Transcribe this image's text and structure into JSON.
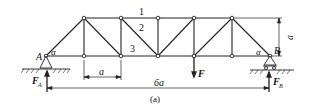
{
  "figure": {
    "caption": "(a)",
    "labels": {
      "support_left": "A",
      "support_right": "B",
      "angle_left": "α",
      "angle_right": "α",
      "member_1": "1",
      "member_2": "2",
      "member_3": "3",
      "panel_width": "a",
      "height": "a",
      "span": "6a",
      "load": "F",
      "reaction_left_main": "F",
      "reaction_left_sub": "A",
      "reaction_right_main": "F",
      "reaction_right_sub": "B"
    },
    "colors": {
      "line": "#222222",
      "background": "#ffffff"
    }
  }
}
